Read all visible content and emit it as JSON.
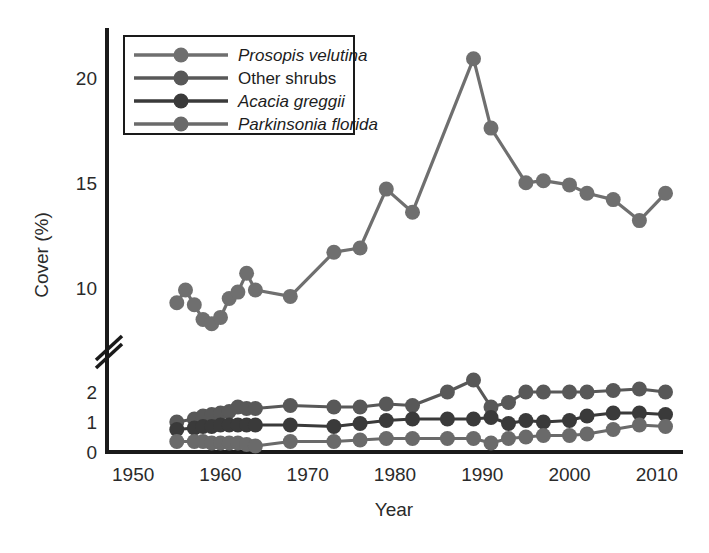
{
  "chart_data": {
    "type": "line",
    "title": "",
    "xlabel": "Year",
    "ylabel": "Cover (%)",
    "xlim": [
      1947,
      2013
    ],
    "xticks": [
      1950,
      1960,
      1970,
      1980,
      1990,
      2000,
      2010
    ],
    "xtick_labels": [
      "1950",
      "1960",
      "1970",
      "1980",
      "1990",
      "2000",
      "2010"
    ],
    "y_axis_broken": true,
    "y_break_note": "axis break between 2 and 10 drawn as double slash",
    "y_lower_segment": {
      "range": [
        0,
        2.6
      ],
      "ticks": [
        0,
        1,
        2
      ],
      "tick_labels": [
        "0",
        "1",
        "2"
      ]
    },
    "y_upper_segment": {
      "range": [
        8.0,
        21.6
      ],
      "ticks": [
        10,
        15,
        20
      ],
      "tick_labels": [
        "10",
        "15",
        "20"
      ]
    },
    "grid": false,
    "legend_position": "top-left inside plot",
    "marker": "filled circle",
    "series": [
      {
        "name": "Prosopis velutina",
        "color": "#6f6f6f",
        "segment": "upper",
        "x": [
          1955,
          1956,
          1957,
          1958,
          1959,
          1960,
          1961,
          1962,
          1963,
          1964,
          1968,
          1973,
          1976,
          1979,
          1982,
          1989,
          1991,
          1995,
          1997,
          2000,
          2002,
          2005,
          2008,
          2011
        ],
        "y": [
          9.3,
          9.9,
          9.2,
          8.5,
          8.3,
          8.6,
          9.5,
          9.8,
          10.7,
          9.9,
          9.6,
          11.7,
          11.9,
          14.7,
          13.6,
          20.9,
          17.6,
          15.0,
          15.1,
          14.9,
          14.5,
          14.2,
          13.2,
          14.5
        ]
      },
      {
        "name": "Other shrubs",
        "color": "#585858",
        "segment": "lower",
        "x": [
          1955,
          1957,
          1958,
          1959,
          1960,
          1961,
          1962,
          1963,
          1964,
          1968,
          1973,
          1976,
          1979,
          1982,
          1986,
          1989,
          1991,
          1993,
          1995,
          1997,
          2000,
          2002,
          2005,
          2008,
          2011
        ],
        "y": [
          1.0,
          1.1,
          1.2,
          1.25,
          1.3,
          1.35,
          1.5,
          1.45,
          1.45,
          1.55,
          1.5,
          1.5,
          1.6,
          1.55,
          2.0,
          2.4,
          1.5,
          1.65,
          2.0,
          2.0,
          2.0,
          2.0,
          2.05,
          2.1,
          2.0
        ]
      },
      {
        "name": "Acacia greggii",
        "color": "#3a3a3a",
        "segment": "lower",
        "x": [
          1955,
          1957,
          1958,
          1959,
          1960,
          1961,
          1962,
          1963,
          1964,
          1968,
          1973,
          1976,
          1979,
          1982,
          1986,
          1989,
          1991,
          1993,
          1995,
          1997,
          2000,
          2002,
          2005,
          2008,
          2011
        ],
        "y": [
          0.75,
          0.8,
          0.85,
          0.85,
          0.9,
          0.9,
          0.9,
          0.9,
          0.9,
          0.9,
          0.85,
          0.95,
          1.05,
          1.1,
          1.1,
          1.1,
          1.15,
          0.95,
          1.05,
          1.0,
          1.05,
          1.2,
          1.3,
          1.3,
          1.25
        ]
      },
      {
        "name": "Parkinsonia florida",
        "color": "#6a6a6a",
        "segment": "lower",
        "x": [
          1955,
          1957,
          1958,
          1959,
          1960,
          1961,
          1962,
          1963,
          1964,
          1968,
          1973,
          1976,
          1979,
          1982,
          1986,
          1989,
          1991,
          1993,
          1995,
          1997,
          2000,
          2002,
          2005,
          2008,
          2011
        ],
        "y": [
          0.35,
          0.35,
          0.35,
          0.3,
          0.3,
          0.3,
          0.3,
          0.25,
          0.2,
          0.35,
          0.35,
          0.4,
          0.45,
          0.45,
          0.45,
          0.45,
          0.3,
          0.45,
          0.5,
          0.55,
          0.55,
          0.6,
          0.75,
          0.9,
          0.85
        ]
      }
    ]
  },
  "legend": {
    "entries": [
      {
        "label": "Prosopis velutina",
        "italic": true,
        "color": "#6f6f6f"
      },
      {
        "label": "Other shrubs",
        "italic": false,
        "color": "#585858"
      },
      {
        "label": "Acacia greggii",
        "italic": true,
        "color": "#3a3a3a"
      },
      {
        "label": "Parkinsonia florida",
        "italic": true,
        "color": "#6a6a6a"
      }
    ]
  },
  "axes": {
    "x_title": "Year",
    "y_title": "Cover (%)",
    "x_tick_labels": [
      "1950",
      "1960",
      "1970",
      "1980",
      "1990",
      "2000",
      "2010"
    ],
    "y_tick_labels_upper": [
      "20",
      "15",
      "10"
    ],
    "y_tick_labels_lower": [
      "2",
      "1",
      "0"
    ],
    "axis_color": "#1a1a1a"
  }
}
